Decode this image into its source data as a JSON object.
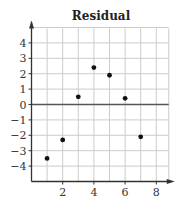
{
  "chart_data": {
    "type": "scatter",
    "title": "Residual",
    "xlabel": "",
    "ylabel": "",
    "x": [
      1,
      2,
      3,
      4,
      5,
      6,
      7
    ],
    "y": [
      -3.5,
      -2.3,
      0.5,
      2.4,
      1.9,
      0.4,
      -2.1
    ],
    "xlim": [
      0,
      8.5
    ],
    "ylim": [
      -5,
      5
    ],
    "x_ticks": [
      2,
      4,
      6,
      8
    ],
    "x_tick_labels": [
      "2",
      "4",
      "6",
      "8"
    ],
    "y_ticks": [
      4,
      3,
      2,
      1,
      0,
      -1,
      -2,
      -3,
      -4
    ],
    "y_tick_labels": [
      "4",
      "3",
      "2",
      "1",
      "0",
      "−1",
      "−2",
      "−3",
      "−4"
    ],
    "grid": true,
    "zero_line": true,
    "legend": null
  },
  "colors": {
    "grid": "#cccccc",
    "axis": "#333333",
    "zero_line": "#555555",
    "point": "#111111"
  }
}
